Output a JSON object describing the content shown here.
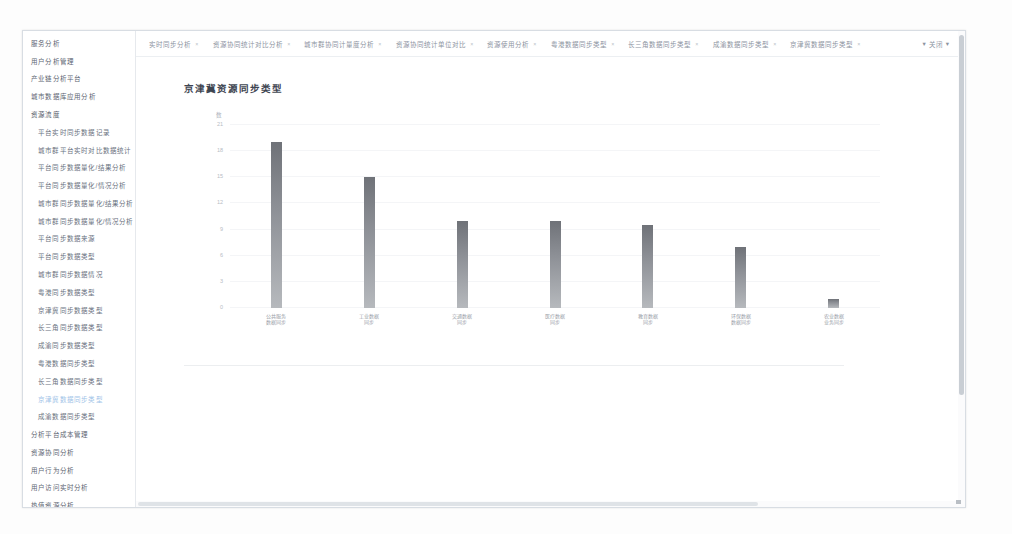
{
  "sidebar": {
    "items": [
      {
        "label": "服务分析",
        "level": "top",
        "active": false
      },
      {
        "label": "用户分析管理",
        "level": "top",
        "active": false
      },
      {
        "label": "产业链分析平台",
        "level": "top",
        "active": false
      },
      {
        "label": "城市数据库应用分析",
        "level": "top",
        "active": false
      },
      {
        "label": "资源流度",
        "level": "group",
        "active": false
      },
      {
        "label": "平台实时同步数据记录",
        "level": "child",
        "active": false
      },
      {
        "label": "城市群平台实时对比数据统计",
        "level": "child",
        "active": false
      },
      {
        "label": "平台同步数据量化/结果分析",
        "level": "child",
        "active": false
      },
      {
        "label": "平台同步数据量化/情况分析",
        "level": "child",
        "active": false
      },
      {
        "label": "城市群同步数据量化/结果分析",
        "level": "child",
        "active": false
      },
      {
        "label": "城市群同步数据量化/情况分析",
        "level": "child",
        "active": false
      },
      {
        "label": "平台同步数据来源",
        "level": "child",
        "active": false
      },
      {
        "label": "平台同步数据类型",
        "level": "child",
        "active": false
      },
      {
        "label": "城市群同步数据情况",
        "level": "child",
        "active": false
      },
      {
        "label": "粤港同步数据类型",
        "level": "child",
        "active": false
      },
      {
        "label": "京津冀同步数据类型",
        "level": "child",
        "active": false
      },
      {
        "label": "长三角同步数据类型",
        "level": "child",
        "active": false
      },
      {
        "label": "成渝同步数据类型",
        "level": "child",
        "active": false
      },
      {
        "label": "粤港数据同步类型",
        "level": "child",
        "active": false
      },
      {
        "label": "长三角数据同步类型",
        "level": "child",
        "active": false
      },
      {
        "label": "京津冀数据同步类型",
        "level": "child",
        "active": true
      },
      {
        "label": "成渝数据同步类型",
        "level": "child",
        "active": false
      },
      {
        "label": "分析平台成本管理",
        "level": "top",
        "active": false
      },
      {
        "label": "资源协同分析",
        "level": "top",
        "active": false
      },
      {
        "label": "用户行为分析",
        "level": "top",
        "active": false
      },
      {
        "label": "用户访问实时分析",
        "level": "top",
        "active": false
      },
      {
        "label": "热值资源分析",
        "level": "top",
        "active": false
      },
      {
        "label": "多平台用户融合",
        "level": "top",
        "active": false
      },
      {
        "label": "服务资源协同实时分析",
        "level": "top",
        "active": false
      }
    ]
  },
  "tabs": {
    "items": [
      {
        "label": "实时同步分析"
      },
      {
        "label": "资源协同统计对比分析"
      },
      {
        "label": "城市群协同计量度分析"
      },
      {
        "label": "资源协同统计单位对比"
      },
      {
        "label": "资源使用分析"
      },
      {
        "label": "粤港数据同步类型"
      },
      {
        "label": "长三角数据同步类型"
      },
      {
        "label": "成渝数据同步类型"
      },
      {
        "label": "京津冀数据同步类型"
      }
    ],
    "close_all_label": "关闭",
    "close_icon": "close-icon",
    "dot_icon": "dot-icon"
  },
  "chart_data": {
    "type": "bar",
    "title": "京津冀资源同步类型",
    "xlabel": "",
    "ylabel": "数",
    "ylim": [
      0,
      21
    ],
    "yticks": [
      0,
      3,
      6,
      9,
      12,
      15,
      18,
      21
    ],
    "grid": true,
    "legend": "none",
    "categories": [
      "公共服务\n数据同步",
      "工业数据\n同步",
      "交通数据\n同步",
      "医疗数据\n同步",
      "教育数据\n同步",
      "环保数据\n数据同步",
      "农业数据\n业务同步"
    ],
    "values": [
      19,
      15,
      10,
      10,
      9.5,
      7,
      1
    ],
    "bar_color_top": "#6f7278",
    "bar_color_bottom": "#b6b9bd"
  },
  "scrollbars": {
    "vertical": "vertical-scrollbar",
    "horizontal": "horizontal-scrollbar"
  }
}
